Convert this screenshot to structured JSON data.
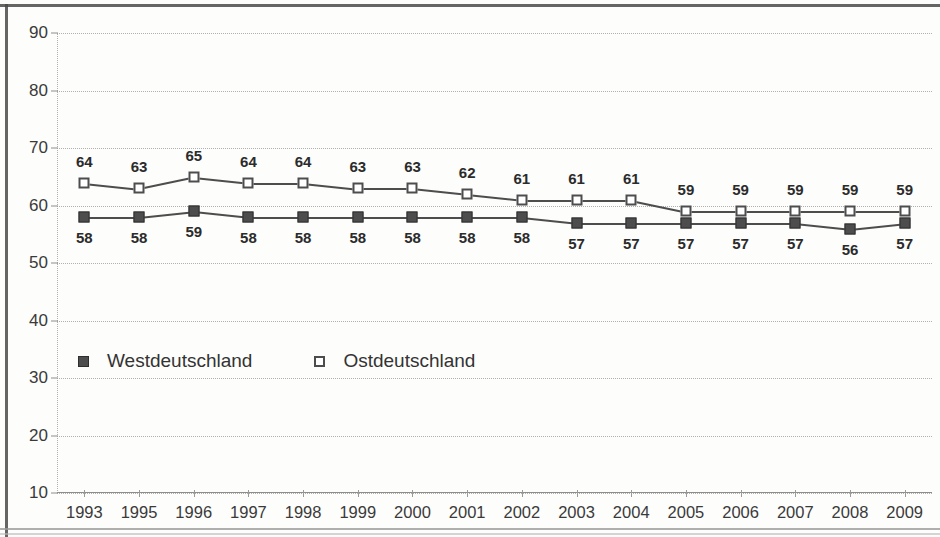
{
  "chart_data": {
    "type": "line",
    "title": "",
    "subtitle": "",
    "xlabel": "",
    "ylabel": "",
    "ylim": [
      10,
      90
    ],
    "ytick_step": 10,
    "yticks": [
      90,
      80,
      70,
      60,
      50,
      40,
      30,
      20,
      10
    ],
    "grid": true,
    "grid_style": "dotted horizontal",
    "legend_position": "inside lower-left",
    "categories": [
      "1993",
      "1995",
      "1996",
      "1997",
      "1998",
      "1999",
      "2000",
      "2001",
      "2002",
      "2003",
      "2004",
      "2005",
      "2006",
      "2007",
      "2008",
      "2009"
    ],
    "series": [
      {
        "name": "Westdeutschland",
        "marker": "filled-square",
        "color": "#4d4d4d",
        "label_position": "below",
        "values": [
          58,
          58,
          59,
          58,
          58,
          58,
          58,
          58,
          58,
          57,
          57,
          57,
          57,
          57,
          56,
          57
        ]
      },
      {
        "name": "Ostdeutschland",
        "marker": "open-square",
        "color": "#4d4d4d",
        "label_position": "above",
        "values": [
          64,
          63,
          65,
          64,
          64,
          63,
          63,
          62,
          61,
          61,
          61,
          59,
          59,
          59,
          59,
          59
        ]
      }
    ]
  },
  "legend": {
    "items": [
      {
        "label": "Westdeutschland",
        "marker": "filled-square"
      },
      {
        "label": "Ostdeutschland",
        "marker": "open-square"
      }
    ]
  }
}
